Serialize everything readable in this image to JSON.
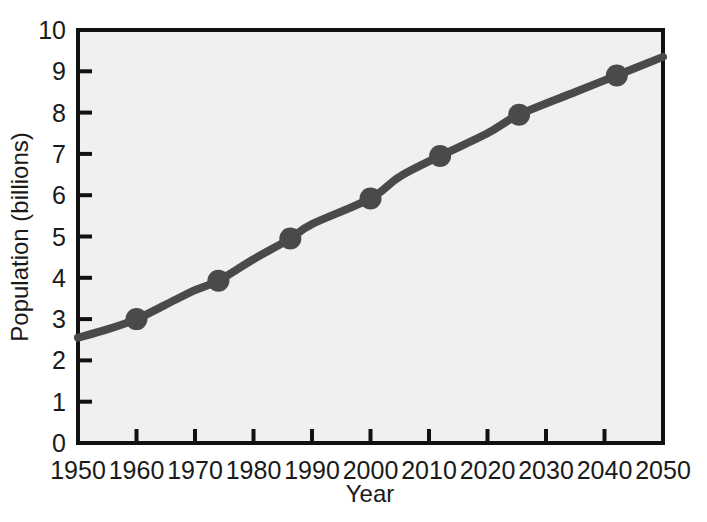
{
  "chart_data": {
    "type": "line",
    "title": "",
    "xlabel": "Year",
    "ylabel": "Population (billions)",
    "xlim": [
      1950,
      2050
    ],
    "ylim": [
      0,
      10
    ],
    "xticks": [
      1950,
      1960,
      1970,
      1980,
      1990,
      2000,
      2010,
      2020,
      2030,
      2040,
      2050
    ],
    "yticks": [
      0,
      1,
      2,
      3,
      4,
      5,
      6,
      7,
      8,
      9,
      10
    ],
    "xtick_labels": [
      "1950",
      "1960",
      "1970",
      "1980",
      "1990",
      "2000",
      "2010",
      "2020",
      "2030",
      "2040",
      "2050"
    ],
    "ytick_labels": [
      "0",
      "1",
      "2",
      "3",
      "4",
      "5",
      "6",
      "7",
      "8",
      "9",
      "10"
    ],
    "grid": false,
    "legend": "none",
    "series": [
      {
        "name": "World population",
        "line_color": "#4a4a4a",
        "marker_color": "#4a4a4a",
        "line_points": [
          {
            "x": 1950,
            "y": 2.55
          },
          {
            "x": 1955,
            "y": 2.75
          },
          {
            "x": 1960,
            "y": 3.0
          },
          {
            "x": 1965,
            "y": 3.35
          },
          {
            "x": 1970,
            "y": 3.7
          },
          {
            "x": 1974,
            "y": 3.93
          },
          {
            "x": 1980,
            "y": 4.45
          },
          {
            "x": 1986.3,
            "y": 4.95
          },
          {
            "x": 1990,
            "y": 5.3
          },
          {
            "x": 2000,
            "y": 5.92
          },
          {
            "x": 2005,
            "y": 6.45
          },
          {
            "x": 2011.9,
            "y": 6.95
          },
          {
            "x": 2020,
            "y": 7.5
          },
          {
            "x": 2025.4,
            "y": 7.95
          },
          {
            "x": 2035,
            "y": 8.5
          },
          {
            "x": 2042.1,
            "y": 8.9
          },
          {
            "x": 2050,
            "y": 9.35
          }
        ],
        "markers": [
          {
            "x": 1960,
            "y": 3.0
          },
          {
            "x": 1974,
            "y": 3.93
          },
          {
            "x": 1986.3,
            "y": 4.95
          },
          {
            "x": 2000,
            "y": 5.92
          },
          {
            "x": 2011.9,
            "y": 6.95
          },
          {
            "x": 2025.4,
            "y": 7.95
          },
          {
            "x": 2042.1,
            "y": 8.9
          }
        ]
      }
    ],
    "colors": {
      "plot_background": "#f0f0f0",
      "figure_background": "#ffffff",
      "axis": "#111111",
      "data": "#4a4a4a",
      "text": "#1a1a1a"
    }
  }
}
